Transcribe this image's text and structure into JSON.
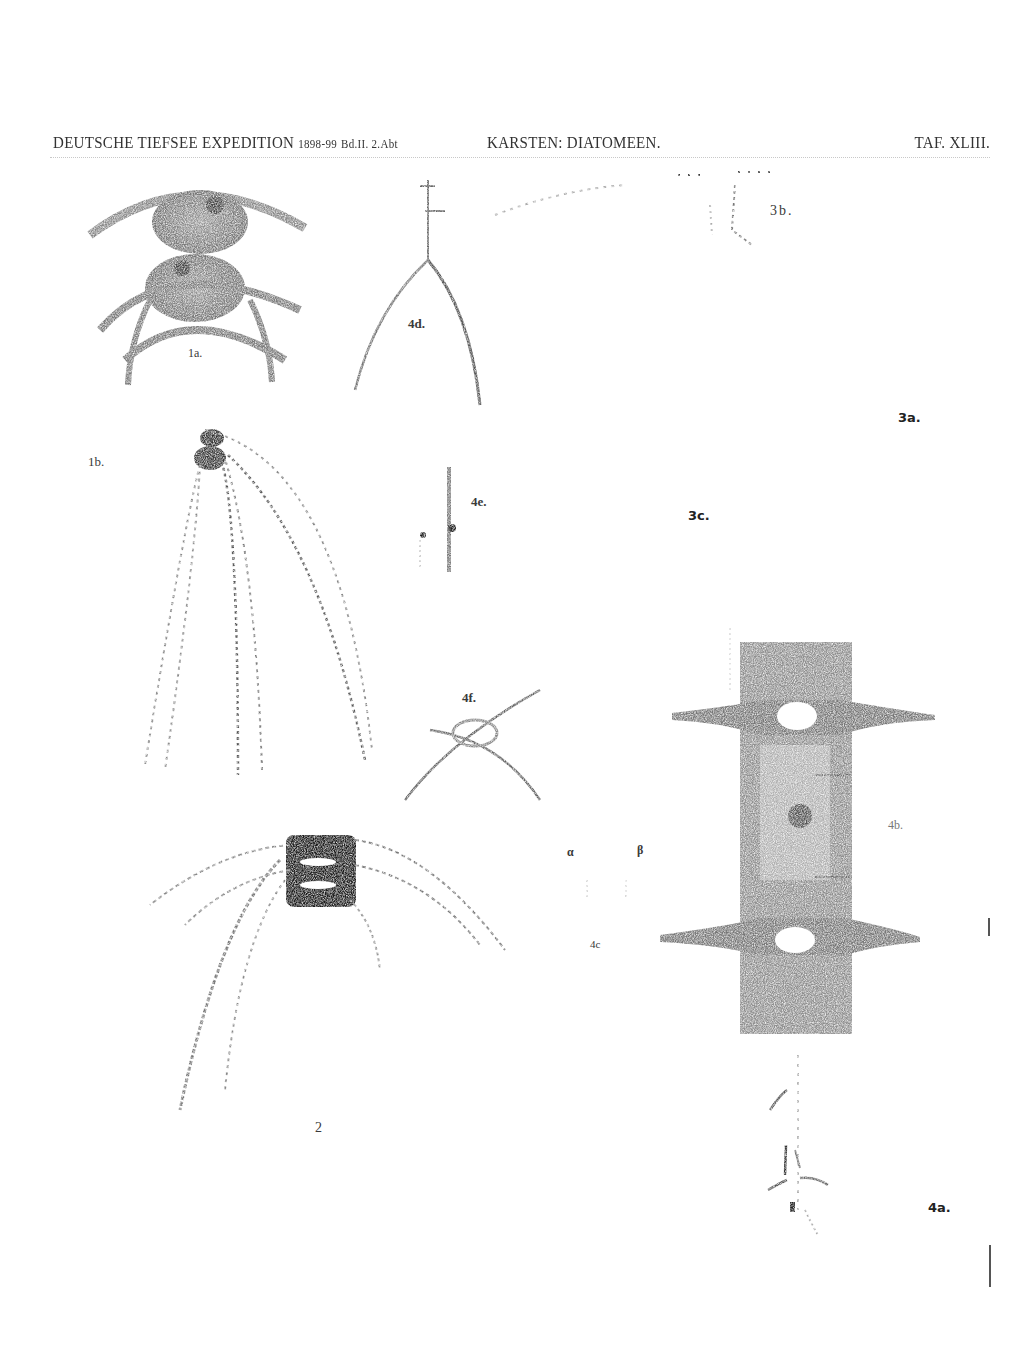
{
  "header": {
    "left": "DEUTSCHE TIEFSEE EXPEDITION",
    "left_years": "1898-99",
    "left_volume": "Bd.II. 2.Abt",
    "center": "KARSTEN: DIATOMEEN.",
    "right": "TAF. XLIII."
  },
  "figures": [
    {
      "id": "1a",
      "label": "1a."
    },
    {
      "id": "1b",
      "label": "1b."
    },
    {
      "id": "2",
      "label": "2"
    },
    {
      "id": "3a",
      "label": "3a."
    },
    {
      "id": "3b",
      "label": "3b."
    },
    {
      "id": "3c",
      "label": "3c."
    },
    {
      "id": "4a",
      "label": "4a."
    },
    {
      "id": "4b",
      "label": "4b."
    },
    {
      "id": "4c",
      "label": "4c"
    },
    {
      "id": "4d",
      "label": "4d."
    },
    {
      "id": "4e",
      "label": "4e."
    },
    {
      "id": "4f",
      "label": "4f."
    }
  ],
  "figure_4c_marks": {
    "alpha": "α",
    "beta": "β"
  }
}
